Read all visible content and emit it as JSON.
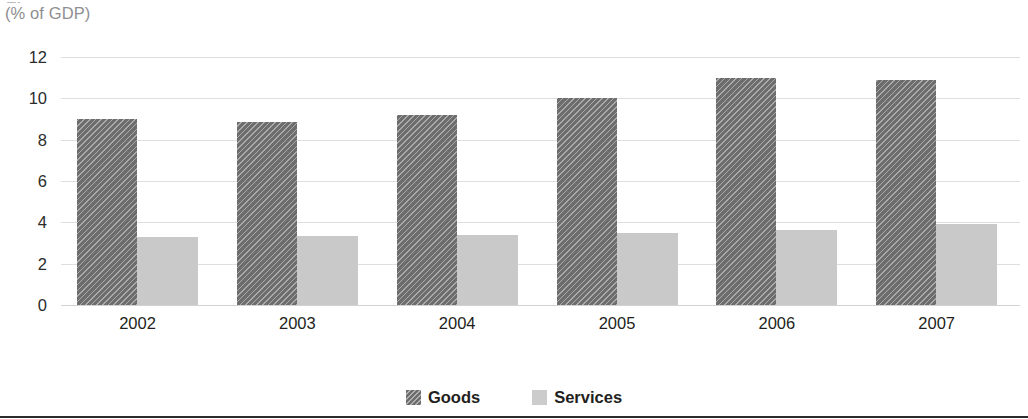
{
  "figure": {
    "title_partial": "Figure",
    "subtitle": "(% of GDP)"
  },
  "legend": {
    "position": "bottom-center",
    "items": [
      {
        "label": "Goods",
        "color": "#6d6d6d",
        "pattern": "diagonal-hatch"
      },
      {
        "label": "Services",
        "color": "#c9c9c9",
        "pattern": "solid"
      }
    ]
  },
  "axis": {
    "yticks": [
      "12",
      "10",
      "8",
      "6",
      "4",
      "2",
      "0"
    ],
    "xticks": [
      "2002",
      "2003",
      "2004",
      "2005",
      "2006",
      "2007"
    ]
  },
  "chart_data": {
    "type": "bar",
    "title": "",
    "subtitle": "(% of GDP)",
    "xlabel": "",
    "ylabel": "(% of GDP)",
    "categories": [
      "2002",
      "2003",
      "2004",
      "2005",
      "2006",
      "2007"
    ],
    "series": [
      {
        "name": "Goods",
        "color": "#6d6d6d",
        "values": [
          9.0,
          8.85,
          9.2,
          10.0,
          11.0,
          10.9
        ]
      },
      {
        "name": "Services",
        "color": "#c9c9c9",
        "values": [
          3.3,
          3.35,
          3.4,
          3.5,
          3.65,
          3.9
        ]
      }
    ],
    "ylim": [
      0,
      12
    ],
    "ytick_step": 2,
    "grid": true,
    "legend_position": "bottom"
  }
}
